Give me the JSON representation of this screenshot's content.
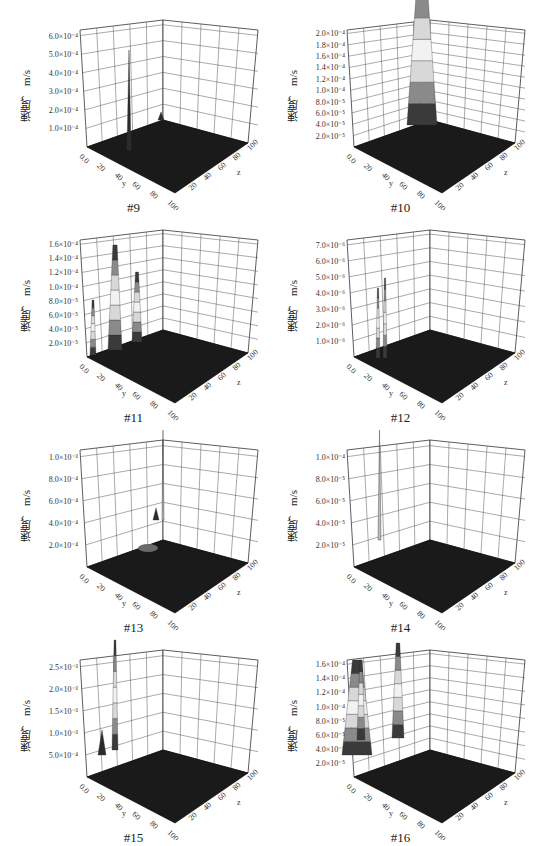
{
  "chart_data": [
    {
      "id": "#9",
      "type": "surface3d",
      "title": "#9",
      "xlabel": "y",
      "ylabel": "速度，m/s",
      "zlabel": "z",
      "x_ticks": [
        "0.0",
        "20",
        "40",
        "60",
        "80",
        "100"
      ],
      "z_ticks": [
        "20",
        "40",
        "60",
        "80",
        "100"
      ],
      "y_ticks": [
        "1.0×10⁻⁴",
        "2.0×10⁻⁴",
        "3.0×10⁻⁴",
        "4.0×10⁻⁴",
        "5.0×10⁻⁴",
        "6.0×10⁻⁴"
      ],
      "ylim": [
        0,
        0.00065
      ],
      "peaks": [
        {
          "y": 22,
          "z": 5,
          "value": 0.00062
        },
        {
          "y": 45,
          "z": 50,
          "value": 2e-05
        }
      ]
    },
    {
      "id": "#10",
      "type": "surface3d",
      "title": "#10",
      "xlabel": "y",
      "ylabel": "速度，m/s",
      "zlabel": "z",
      "x_ticks": [
        "0.0",
        "20",
        "40",
        "60",
        "80",
        "100"
      ],
      "z_ticks": [
        "20",
        "40",
        "60",
        "80",
        "100"
      ],
      "y_ticks": [
        "2.0×10⁻⁵",
        "4.0×10⁻⁵",
        "6.0×10⁻⁵",
        "8.0×10⁻⁵",
        "1.0×10⁻⁴",
        "1.2×10⁻⁴",
        "1.4×10⁻⁴",
        "1.6×10⁻⁴",
        "1.8×10⁻⁴",
        "2.0×10⁻⁴"
      ],
      "ylim": [
        0,
        0.0002
      ],
      "peaks": [
        {
          "y": 40,
          "z": 10,
          "value": 0.0002
        }
      ]
    },
    {
      "id": "#11",
      "type": "surface3d",
      "title": "#11",
      "xlabel": "y",
      "ylabel": "速度，m/s",
      "zlabel": "z",
      "x_ticks": [
        "0.0",
        "20",
        "40",
        "60",
        "80",
        "100"
      ],
      "z_ticks": [
        "20",
        "40",
        "60",
        "80",
        "100"
      ],
      "y_ticks": [
        "2.0×10⁻⁵",
        "4.0×10⁻⁵",
        "6.0×10⁻⁵",
        "8.0×10⁻⁵",
        "1.0×10⁻⁴",
        "1.2×10⁻⁴",
        "1.4×10⁻⁴",
        "1.6×10⁻⁴"
      ],
      "ylim": [
        0,
        0.00017
      ],
      "peaks": [
        {
          "y": 2,
          "z": 2,
          "value": 0.0001
        },
        {
          "y": 20,
          "z": 5,
          "value": 0.000165
        },
        {
          "y": 38,
          "z": 15,
          "value": 0.00012
        }
      ]
    },
    {
      "id": "#12",
      "type": "surface3d",
      "title": "#12",
      "xlabel": "y",
      "ylabel": "速度，m/s",
      "zlabel": "z",
      "x_ticks": [
        "0.0",
        "20",
        "40",
        "60",
        "80",
        "100"
      ],
      "z_ticks": [
        "20",
        "40",
        "60",
        "80",
        "100"
      ],
      "y_ticks": [
        "1.0×10⁻⁶",
        "2.0×10⁻⁶",
        "3.0×10⁻⁶",
        "4.0×10⁻⁶",
        "5.0×10⁻⁶",
        "6.0×10⁻⁶",
        "7.0×10⁻⁶"
      ],
      "ylim": [
        0,
        7e-06
      ],
      "peaks": [
        {
          "y": 30,
          "z": 5,
          "value": 4.5e-06
        },
        {
          "y": 36,
          "z": 5,
          "value": 5.2e-06
        }
      ]
    },
    {
      "id": "#13",
      "type": "surface3d",
      "title": "#13",
      "xlabel": "y",
      "ylabel": "速度，m/s",
      "zlabel": "z",
      "x_ticks": [
        "0.0",
        "20",
        "40",
        "60",
        "80",
        "100"
      ],
      "z_ticks": [
        "20",
        "40",
        "60",
        "80",
        "100"
      ],
      "y_ticks": [
        "2.0×10⁻⁴",
        "4.0×10⁻⁴",
        "6.0×10⁻⁴",
        "8.0×10⁻⁴",
        "1.0×10⁻³"
      ],
      "ylim": [
        0,
        0.0011
      ],
      "peaks": [
        {
          "y": 40,
          "z": 30,
          "value": 0.00015
        },
        {
          "y": 50,
          "z": 80,
          "value": 0.001
        },
        {
          "y": 30,
          "z": 10,
          "value": 3e-05
        }
      ]
    },
    {
      "id": "#14",
      "type": "surface3d",
      "title": "#14",
      "xlabel": "y",
      "ylabel": "速度，m/s",
      "zlabel": "z",
      "x_ticks": [
        "0.0",
        "20",
        "40",
        "60",
        "80",
        "100"
      ],
      "z_ticks": [
        "20",
        "40",
        "60",
        "80",
        "100"
      ],
      "y_ticks": [
        "2.0×10⁻⁵",
        "4.0×10⁻⁵",
        "6.0×10⁻⁵",
        "8.0×10⁻⁵",
        "1.0×10⁻⁴"
      ],
      "ylim": [
        0,
        0.0001
      ],
      "peaks": [
        {
          "y": 32,
          "z": 5,
          "value": 9e-05
        }
      ]
    },
    {
      "id": "#15",
      "type": "surface3d",
      "title": "#15",
      "xlabel": "y",
      "ylabel": "速度，m/s",
      "zlabel": "z",
      "x_ticks": [
        "0.0",
        "20",
        "40",
        "60",
        "80",
        "100"
      ],
      "z_ticks": [
        "20",
        "40",
        "60",
        "80",
        "100"
      ],
      "y_ticks": [
        "5.0×10⁻⁴",
        "1.0×10⁻³",
        "1.5×10⁻³",
        "2.0×10⁻³",
        "2.5×10⁻³"
      ],
      "ylim": [
        0,
        0.0026
      ],
      "peaks": [
        {
          "y": 10,
          "z": 2,
          "value": 0.0006
        },
        {
          "y": 20,
          "z": 5,
          "value": 0.0025
        }
      ]
    },
    {
      "id": "#16",
      "type": "surface3d",
      "title": "#16",
      "xlabel": "y",
      "ylabel": "速度，m/s",
      "zlabel": "z",
      "x_ticks": [
        "0.0",
        "20",
        "40",
        "60",
        "80",
        "100"
      ],
      "z_ticks": [
        "20",
        "40",
        "60",
        "80",
        "100"
      ],
      "y_ticks": [
        "2.0×10⁻⁵",
        "4.0×10⁻⁵",
        "6.0×10⁻⁵",
        "8.0×10⁻⁵",
        "1.0×10⁻⁴",
        "1.2×10⁻⁴",
        "1.4×10⁻⁴",
        "1.6×10⁻⁴"
      ],
      "ylim": [
        0,
        0.00016
      ],
      "peaks": [
        {
          "y": 2,
          "z": 2,
          "value": 0.00014
        },
        {
          "y": 12,
          "z": 5,
          "value": 0.00012
        },
        {
          "y": 40,
          "z": 20,
          "value": 0.00015
        }
      ]
    }
  ],
  "panels": [
    {
      "caption": "#9",
      "ylabel": "速度， m/s",
      "ticks": [
        "6.0×10⁻⁴",
        "5.0×10⁻⁴",
        "4.0×10⁻⁴",
        "3.0×10⁻⁴",
        "2.0×10⁻⁴",
        "1.0×10⁻⁴"
      ]
    },
    {
      "caption": "#10",
      "ylabel": "速度， m/s",
      "ticks": [
        "2.0×10⁻⁴",
        "1.8×10⁻⁴",
        "1.6×10⁻⁴",
        "1.4×10⁻⁴",
        "1.2×10⁻⁴",
        "1.0×10⁻⁴",
        "8.0×10⁻⁵",
        "6.0×10⁻⁵",
        "4.0×10⁻⁵",
        "2.0×10⁻⁵"
      ]
    },
    {
      "caption": "#11",
      "ylabel": "速度， m/s",
      "ticks": [
        "1.6×10⁻⁴",
        "1.4×10⁻⁴",
        "1.2×10⁻⁴",
        "1.0×10⁻⁴",
        "8.0×10⁻⁵",
        "6.0×10⁻⁵",
        "4.0×10⁻⁵",
        "2.0×10⁻⁵"
      ]
    },
    {
      "caption": "#12",
      "ylabel": "速度， m/s",
      "ticks": [
        "7.0×10⁻⁶",
        "6.0×10⁻⁶",
        "5.0×10⁻⁶",
        "4.0×10⁻⁶",
        "3.0×10⁻⁶",
        "2.0×10⁻⁶",
        "1.0×10⁻⁶"
      ]
    },
    {
      "caption": "#13",
      "ylabel": "速度， m/s",
      "ticks": [
        "1.0×10⁻³",
        "8.0×10⁻⁴",
        "6.0×10⁻⁴",
        "4.0×10⁻⁴",
        "2.0×10⁻⁴"
      ]
    },
    {
      "caption": "#14",
      "ylabel": "速度， m/s",
      "ticks": [
        "1.0×10⁻⁴",
        "8.0×10⁻⁵",
        "6.0×10⁻⁵",
        "4.0×10⁻⁵",
        "2.0×10⁻⁵"
      ]
    },
    {
      "caption": "#15",
      "ylabel": "速度， m/s",
      "ticks": [
        "2.5×10⁻³",
        "2.0×10⁻³",
        "1.5×10⁻³",
        "1.0×10⁻³",
        "5.0×10⁻⁴"
      ]
    },
    {
      "caption": "#16",
      "ylabel": "速度， m/s",
      "ticks": [
        "1.6×10⁻⁴",
        "1.4×10⁻⁴",
        "1.2×10⁻⁴",
        "1.0×10⁻⁴",
        "8.0×10⁻⁵",
        "6.0×10⁻⁵",
        "4.0×10⁻⁵",
        "2.0×10⁻⁵"
      ]
    }
  ],
  "axes": {
    "y_axis_letter": "y",
    "z_axis_letter": "z",
    "y_ticks": [
      "0.0",
      "20",
      "40",
      "60",
      "80",
      "100"
    ],
    "z_ticks": [
      "20",
      "40",
      "60",
      "80",
      "100"
    ]
  },
  "colors": {
    "floor": "#1a1a1a",
    "grid": "#555555",
    "band_dark": "#3a3a3a",
    "band_mid": "#8a8a8a",
    "band_light": "#d8d8d8"
  }
}
